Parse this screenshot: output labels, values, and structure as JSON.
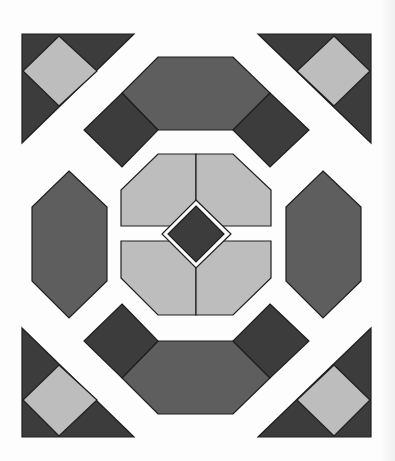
{
  "colors": {
    "background": "#fdfdfd",
    "dark": "#3c3c3c",
    "medium": "#5e5e5e",
    "light": "#bdbdbd",
    "stroke": "#1e1e1e"
  },
  "pattern": {
    "description": "Quilt block with corner triangles, hexagons, dark squares and central light octagon with dark diamond",
    "pieces": [
      {
        "type": "corner-triangle",
        "position": "top-left"
      },
      {
        "type": "corner-triangle",
        "position": "top-right"
      },
      {
        "type": "corner-triangle",
        "position": "bottom-left"
      },
      {
        "type": "corner-triangle",
        "position": "bottom-right"
      },
      {
        "type": "hexagon",
        "position": "top"
      },
      {
        "type": "hexagon",
        "position": "bottom"
      },
      {
        "type": "hexagon",
        "position": "left"
      },
      {
        "type": "hexagon",
        "position": "right"
      },
      {
        "type": "dark-square",
        "count": 4
      },
      {
        "type": "center-octagon",
        "quarters": 4
      },
      {
        "type": "center-diamond"
      }
    ]
  }
}
